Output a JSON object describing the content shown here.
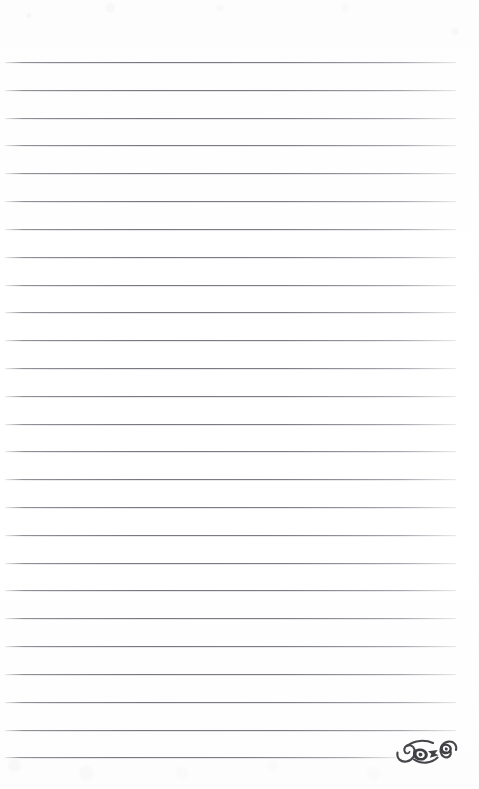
{
  "page": {
    "kind": "lined-notebook-page",
    "width": 479,
    "height": 789,
    "background_color": "#fefefe",
    "content_text": ""
  },
  "rules": {
    "count": 26,
    "first_line_y": 62,
    "spacing": 27.8,
    "left_x": 5,
    "right_x": 456,
    "color": "#6c6c76",
    "thickness": 1,
    "last_line_right_x": 396
  },
  "lines": [
    {
      "index": 1,
      "y": 62,
      "x1": 5,
      "x2": 456,
      "text": ""
    },
    {
      "index": 2,
      "y": 90,
      "x1": 5,
      "x2": 456,
      "text": ""
    },
    {
      "index": 3,
      "y": 118,
      "x1": 5,
      "x2": 456,
      "text": ""
    },
    {
      "index": 4,
      "y": 145,
      "x1": 5,
      "x2": 456,
      "text": ""
    },
    {
      "index": 5,
      "y": 173,
      "x1": 5,
      "x2": 456,
      "text": ""
    },
    {
      "index": 6,
      "y": 201,
      "x1": 5,
      "x2": 456,
      "text": ""
    },
    {
      "index": 7,
      "y": 229,
      "x1": 5,
      "x2": 456,
      "text": ""
    },
    {
      "index": 8,
      "y": 257,
      "x1": 5,
      "x2": 456,
      "text": ""
    },
    {
      "index": 9,
      "y": 285,
      "x1": 5,
      "x2": 456,
      "text": ""
    },
    {
      "index": 10,
      "y": 312,
      "x1": 5,
      "x2": 456,
      "text": ""
    },
    {
      "index": 11,
      "y": 340,
      "x1": 5,
      "x2": 456,
      "text": ""
    },
    {
      "index": 12,
      "y": 368,
      "x1": 5,
      "x2": 456,
      "text": ""
    },
    {
      "index": 13,
      "y": 396,
      "x1": 5,
      "x2": 456,
      "text": ""
    },
    {
      "index": 14,
      "y": 424,
      "x1": 5,
      "x2": 456,
      "text": ""
    },
    {
      "index": 15,
      "y": 451,
      "x1": 5,
      "x2": 456,
      "text": ""
    },
    {
      "index": 16,
      "y": 479,
      "x1": 5,
      "x2": 456,
      "text": ""
    },
    {
      "index": 17,
      "y": 507,
      "x1": 5,
      "x2": 456,
      "text": ""
    },
    {
      "index": 18,
      "y": 535,
      "x1": 5,
      "x2": 456,
      "text": ""
    },
    {
      "index": 19,
      "y": 563,
      "x1": 5,
      "x2": 456,
      "text": ""
    },
    {
      "index": 20,
      "y": 590,
      "x1": 5,
      "x2": 456,
      "text": ""
    },
    {
      "index": 21,
      "y": 618,
      "x1": 5,
      "x2": 456,
      "text": ""
    },
    {
      "index": 22,
      "y": 646,
      "x1": 5,
      "x2": 456,
      "text": ""
    },
    {
      "index": 23,
      "y": 674,
      "x1": 5,
      "x2": 456,
      "text": ""
    },
    {
      "index": 24,
      "y": 702,
      "x1": 5,
      "x2": 456,
      "text": ""
    },
    {
      "index": 25,
      "y": 730,
      "x1": 5,
      "x2": 456,
      "text": ""
    },
    {
      "index": 26,
      "y": 757,
      "x1": 5,
      "x2": 396,
      "text": ""
    }
  ],
  "ornament": {
    "name": "decorative-flourish",
    "description": "double spiral scroll flourish",
    "x": 394,
    "y": 738,
    "width": 66,
    "height": 30,
    "color": "#4a4a4e"
  }
}
